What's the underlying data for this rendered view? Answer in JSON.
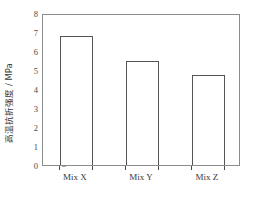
{
  "chart_data": {
    "type": "bar",
    "title": "",
    "xlabel": "",
    "ylabel": "高温抗折强度 / MPa",
    "categories": [
      "Mix X",
      "Mix Y",
      "Mix Z"
    ],
    "values": [
      6.8,
      5.48,
      4.73
    ],
    "series": [
      {
        "name": "高温抗折强度",
        "values": [
          6.8,
          5.48,
          4.73
        ]
      }
    ],
    "ylim": [
      0,
      8
    ],
    "xlim": [
      0,
      3
    ],
    "ytick_labels": [
      "0",
      "1",
      "2",
      "3",
      "4",
      "5",
      "6",
      "7",
      "8"
    ],
    "ytick_values": [
      0,
      1,
      2,
      3,
      4,
      5,
      6,
      7,
      8
    ],
    "grid": false,
    "legend": null,
    "legend_position": "none",
    "bar_fill_color": "#ffffff",
    "bar_edge_color": "#555555",
    "frame_color": "#8c8c8c",
    "units": "MPa"
  }
}
